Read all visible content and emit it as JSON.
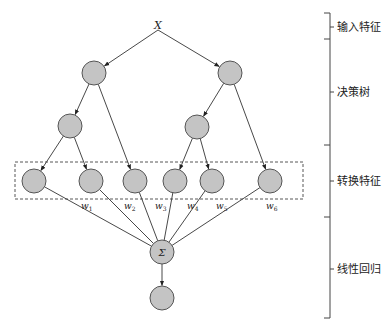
{
  "diagram": {
    "input_label": "X",
    "sum_label": "Σ",
    "weights": [
      {
        "base": "w",
        "sub": "1"
      },
      {
        "base": "w",
        "sub": "2"
      },
      {
        "base": "w",
        "sub": "3"
      },
      {
        "base": "w",
        "sub": "4"
      },
      {
        "base": "w",
        "sub": "5"
      },
      {
        "base": "w",
        "sub": "6"
      }
    ],
    "layers": [
      {
        "id": "input",
        "label": "输入特征"
      },
      {
        "id": "trees",
        "label": "决策树"
      },
      {
        "id": "transformed",
        "label": "转换特征"
      },
      {
        "id": "linear",
        "label": "线性回归"
      }
    ],
    "tree_structure": {
      "trees": [
        {
          "root": "t1-root",
          "children": [
            "t1-mid",
            "leaf-3"
          ],
          "mid_children": [
            "leaf-1",
            "leaf-2"
          ]
        },
        {
          "root": "t2-root",
          "children": [
            "t2-mid",
            "leaf-6"
          ],
          "mid_children": [
            "leaf-4",
            "leaf-5"
          ]
        }
      ],
      "leaf_count": 6
    },
    "colors": {
      "node_fill": "#c4c4c4",
      "node_stroke": "#555555",
      "line": "#333333"
    }
  }
}
